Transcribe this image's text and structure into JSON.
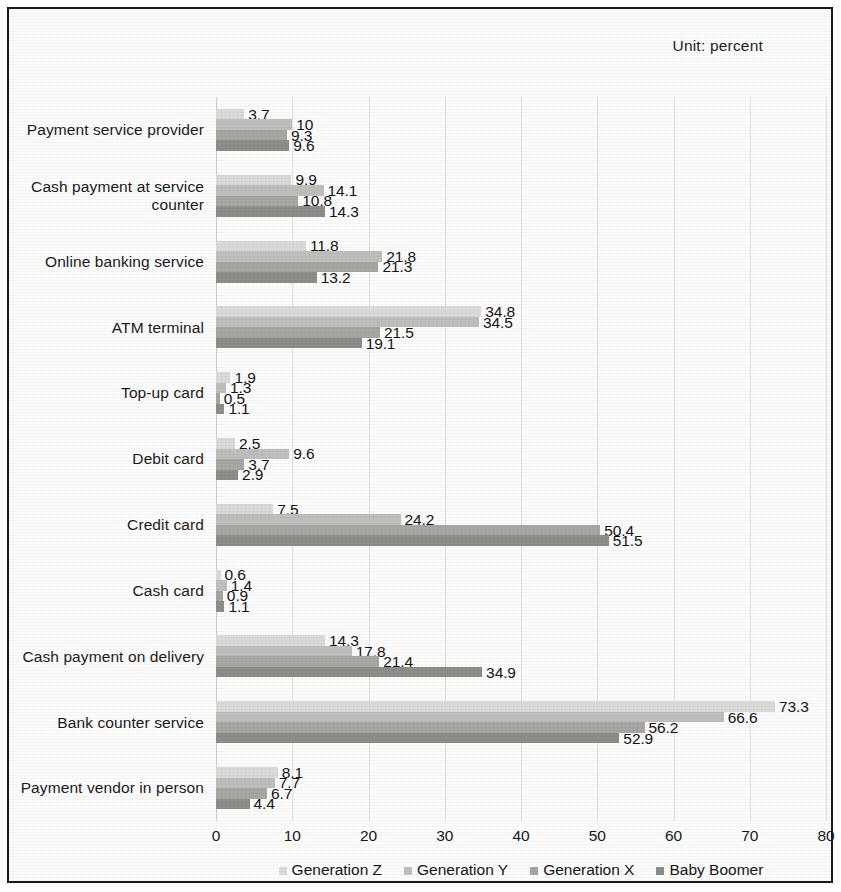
{
  "unit_caption": "Unit: percent",
  "chart_data": {
    "type": "bar",
    "orientation": "horizontal",
    "title": "",
    "subtitle": "",
    "xlabel": "",
    "ylabel": "",
    "xlim": [
      0,
      80
    ],
    "xticks": [
      "0",
      "10",
      "20",
      "30",
      "40",
      "50",
      "60",
      "70",
      "80"
    ],
    "grid": true,
    "legend_position": "bottom",
    "unit": "percent",
    "categories": [
      "Payment service provider",
      "Cash payment at service counter",
      "Online banking service",
      "ATM terminal",
      "Top-up card",
      "Debit card",
      "Credit card",
      "Cash card",
      "Cash payment on delivery",
      "Bank counter service",
      "Payment vendor in person"
    ],
    "series": [
      {
        "name": "Generation Z",
        "color": "#dcdcda",
        "values": [
          3.7,
          9.9,
          11.8,
          34.8,
          1.9,
          2.5,
          7.5,
          0.6,
          14.3,
          73.3,
          8.1
        ]
      },
      {
        "name": "Generation Y",
        "color": "#c0c0bd",
        "values": [
          10,
          14.1,
          21.8,
          34.5,
          1.3,
          9.6,
          24.2,
          1.4,
          17.8,
          66.6,
          7.7
        ]
      },
      {
        "name": "Generation X",
        "color": "#a8a8a5",
        "values": [
          9.3,
          10.8,
          21.3,
          21.5,
          0.5,
          3.7,
          50.4,
          0.9,
          21.4,
          56.2,
          6.7
        ]
      },
      {
        "name": "Baby Boomer",
        "color": "#8e8e8b",
        "values": [
          9.6,
          14.3,
          13.2,
          19.1,
          1.1,
          2.9,
          51.5,
          1.1,
          34.9,
          52.9,
          4.4
        ]
      }
    ],
    "value_labels": [
      [
        "3.7",
        "10",
        "9.3",
        "9.6"
      ],
      [
        "9.9",
        "14.1",
        "10.8",
        "14.3"
      ],
      [
        "11.8",
        "21.8",
        "21.3",
        "13.2"
      ],
      [
        "34.8",
        "34.5",
        "21.5",
        "19.1"
      ],
      [
        "1.9",
        "1.3",
        "0.5",
        "1.1"
      ],
      [
        "2.5",
        "9.6",
        "3.7",
        "2.9"
      ],
      [
        "7.5",
        "24.2",
        "50.4",
        "51.5"
      ],
      [
        "0.6",
        "1.4",
        "0.9",
        "1.1"
      ],
      [
        "14.3",
        "17.8",
        "21.4",
        "34.9"
      ],
      [
        "73.3",
        "66.6",
        "56.2",
        "52.9"
      ],
      [
        "8.1",
        "7.7",
        "6.7",
        "4.4"
      ]
    ]
  }
}
